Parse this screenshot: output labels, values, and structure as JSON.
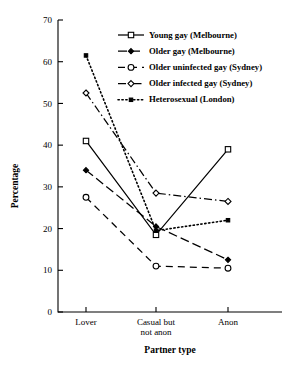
{
  "chart_data": {
    "type": "line",
    "title": "",
    "xlabel": "Partner type",
    "ylabel": "Percentage",
    "categories": [
      "Lover",
      "Casual but not anon",
      "Anon"
    ],
    "category_lines": [
      [
        "Lover"
      ],
      [
        "Casual but",
        "not anon"
      ],
      [
        "Anon"
      ]
    ],
    "ylim": [
      0,
      70
    ],
    "yticks": [
      0,
      10,
      20,
      30,
      40,
      50,
      60,
      70
    ],
    "ytick_labels": [
      "0",
      "10",
      "20",
      "30",
      "40",
      "50",
      "60",
      "70"
    ],
    "grid": false,
    "legend_position": "top-right",
    "series": [
      {
        "name": "Young gay (Melbourne)",
        "values": [
          41,
          18.5,
          39
        ],
        "marker": "open-square",
        "dash": "solid",
        "color": "#000000"
      },
      {
        "name": "Older gay (Melbourne)",
        "values": [
          34,
          20.5,
          12.5
        ],
        "marker": "filled-diamond",
        "dash": "dashed-long",
        "color": "#000000"
      },
      {
        "name": "Older uninfected gay (Sydney)",
        "values": [
          27.5,
          11,
          10.5
        ],
        "marker": "open-circle",
        "dash": "dashed",
        "color": "#000000"
      },
      {
        "name": "Older infected gay (Sydney)",
        "values": [
          52.5,
          28.5,
          26.5
        ],
        "marker": "open-diamond",
        "dash": "dash-dot",
        "color": "#000000"
      },
      {
        "name": "Heterosexual (London)",
        "values": [
          61.5,
          19.5,
          22
        ],
        "marker": "filled-square",
        "dash": "dotted",
        "color": "#000000"
      }
    ]
  },
  "axes": {
    "y_title": "Percentage",
    "x_title": "Partner type"
  }
}
